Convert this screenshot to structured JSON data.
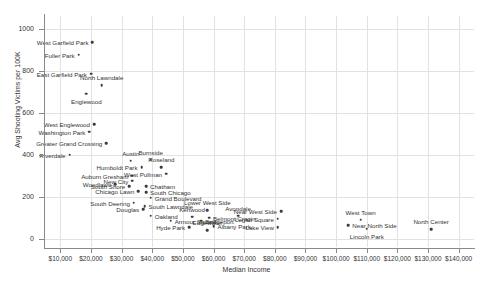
{
  "chart_data": {
    "type": "scatter",
    "title": "",
    "xlabel": "Median Income",
    "ylabel": "Avg Shooting Victims per 100K",
    "xlim": [
      5000,
      145000
    ],
    "ylim": [
      -40,
      1060
    ],
    "grid": true,
    "legend": "none",
    "x_ticks": [
      "$10,000",
      "$20,000",
      "$30,000",
      "$40,000",
      "$50,000",
      "$60,000",
      "$70,000",
      "$80,000",
      "$90,000",
      "$100,000",
      "$110,000",
      "$120,000",
      "$130,000",
      "$140,000"
    ],
    "x_tick_values": [
      10000,
      20000,
      30000,
      40000,
      50000,
      60000,
      70000,
      80000,
      90000,
      100000,
      110000,
      120000,
      130000,
      140000
    ],
    "y_ticks": [
      "0",
      "200",
      "400",
      "600",
      "800",
      "1000"
    ],
    "y_tick_values": [
      0,
      200,
      400,
      600,
      800,
      1000
    ],
    "points": [
      {
        "label": "West Garfield Park",
        "x": 20500,
        "y": 935,
        "pos": "left"
      },
      {
        "label": "Fuller Park",
        "x": 16000,
        "y": 875,
        "pos": "left"
      },
      {
        "label": "East Garfield Park",
        "x": 20000,
        "y": 785,
        "pos": "left"
      },
      {
        "label": "North Lawndale",
        "x": 23500,
        "y": 730,
        "pos": "above"
      },
      {
        "label": "Englewood",
        "x": 18500,
        "y": 690,
        "pos": "below"
      },
      {
        "label": "West Englewood",
        "x": 21000,
        "y": 545,
        "pos": "left"
      },
      {
        "label": "Washington Park",
        "x": 19500,
        "y": 510,
        "pos": "left"
      },
      {
        "label": "Greater Grand Crossing",
        "x": 25000,
        "y": 455,
        "pos": "left"
      },
      {
        "label": "Riverdale",
        "x": 13000,
        "y": 400,
        "pos": "left"
      },
      {
        "label": "Austin",
        "x": 33000,
        "y": 370,
        "pos": "above"
      },
      {
        "label": "Burnside",
        "x": 39500,
        "y": 375,
        "pos": "above"
      },
      {
        "label": "Humboldt Park",
        "x": 36500,
        "y": 340,
        "pos": "left"
      },
      {
        "label": "Roseland",
        "x": 43000,
        "y": 340,
        "pos": "above"
      },
      {
        "label": "West Pullman",
        "x": 44500,
        "y": 310,
        "pos": "left"
      },
      {
        "label": "Auburn Gresham",
        "x": 33500,
        "y": 300,
        "pos": "left"
      },
      {
        "label": "New City",
        "x": 33500,
        "y": 275,
        "pos": "left"
      },
      {
        "label": "Woodlawn",
        "x": 28000,
        "y": 260,
        "pos": "left"
      },
      {
        "label": "South Shore",
        "x": 32500,
        "y": 250,
        "pos": "left"
      },
      {
        "label": "Chatham",
        "x": 38000,
        "y": 250,
        "pos": "right"
      },
      {
        "label": "Chicago Lawn",
        "x": 35500,
        "y": 225,
        "pos": "left"
      },
      {
        "label": "South Chicago",
        "x": 38000,
        "y": 222,
        "pos": "right"
      },
      {
        "label": "Grand Boulevard",
        "x": 39500,
        "y": 195,
        "pos": "right"
      },
      {
        "label": "South Deering",
        "x": 34000,
        "y": 170,
        "pos": "left"
      },
      {
        "label": "South Lawndale",
        "x": 37500,
        "y": 155,
        "pos": "right"
      },
      {
        "label": "Douglas",
        "x": 37000,
        "y": 140,
        "pos": "left"
      },
      {
        "label": "Oakland",
        "x": 39500,
        "y": 110,
        "pos": "right"
      },
      {
        "label": "Kenwood",
        "x": 53000,
        "y": 105,
        "pos": "above"
      },
      {
        "label": "Lower West Side",
        "x": 58000,
        "y": 135,
        "pos": "above"
      },
      {
        "label": "Near West Side",
        "x": 82000,
        "y": 130,
        "pos": "left"
      },
      {
        "label": "Armour Square",
        "x": 46000,
        "y": 85,
        "pos": "right"
      },
      {
        "label": "Bridgeport",
        "x": 56000,
        "y": 85,
        "pos": "right"
      },
      {
        "label": "Belmont Cragin",
        "x": 58500,
        "y": 100,
        "pos": "right"
      },
      {
        "label": "Avondale",
        "x": 68000,
        "y": 110,
        "pos": "above"
      },
      {
        "label": "Logan Square",
        "x": 81000,
        "y": 95,
        "pos": "left"
      },
      {
        "label": "Albany Park",
        "x": 60000,
        "y": 60,
        "pos": "right"
      },
      {
        "label": "Hyde Park",
        "x": 52000,
        "y": 55,
        "pos": "left"
      },
      {
        "label": "Edgewater",
        "x": 58000,
        "y": 40,
        "pos": "above"
      },
      {
        "label": "Lake View",
        "x": 81000,
        "y": 55,
        "pos": "left"
      },
      {
        "label": "West Town",
        "x": 108000,
        "y": 90,
        "pos": "above"
      },
      {
        "label": "Near North Side",
        "x": 104000,
        "y": 65,
        "pos": "right"
      },
      {
        "label": "Lincoln Park",
        "x": 110000,
        "y": 48,
        "pos": "below"
      },
      {
        "label": "North Center",
        "x": 131000,
        "y": 45,
        "pos": "above"
      }
    ]
  }
}
